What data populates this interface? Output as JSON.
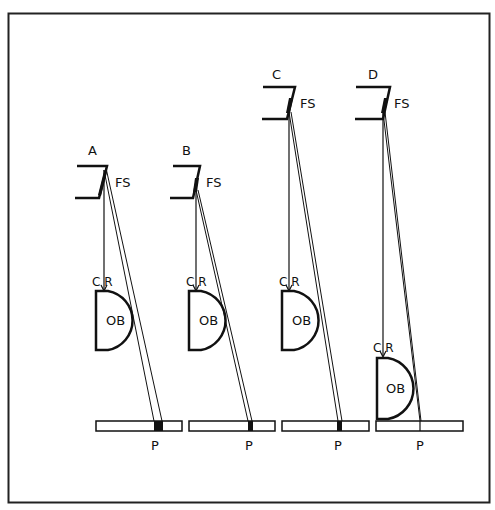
{
  "figure": {
    "type": "optical-ray-diagram",
    "colors": {
      "ink": "#111111",
      "background": "#ffffff",
      "frame": "#222222"
    },
    "labels": {
      "field_stop": "FS",
      "objective": "OB",
      "central_ray": "C R",
      "image_plane": "P"
    },
    "panels": [
      {
        "id": "A",
        "label": "A",
        "fs_label": "FS",
        "cr_label": "C R",
        "ob_label": "OB",
        "p_label": "P",
        "spot": "large"
      },
      {
        "id": "B",
        "label": "B",
        "fs_label": "FS",
        "cr_label": "C R",
        "ob_label": "OB",
        "p_label": "P",
        "spot": "small"
      },
      {
        "id": "C",
        "label": "C",
        "fs_label": "FS",
        "cr_label": "C R",
        "ob_label": "OB",
        "p_label": "P",
        "spot": "small"
      },
      {
        "id": "D",
        "label": "D",
        "fs_label": "FS",
        "cr_label": "C R",
        "ob_label": "OB",
        "p_label": "P",
        "spot": "none"
      }
    ]
  }
}
